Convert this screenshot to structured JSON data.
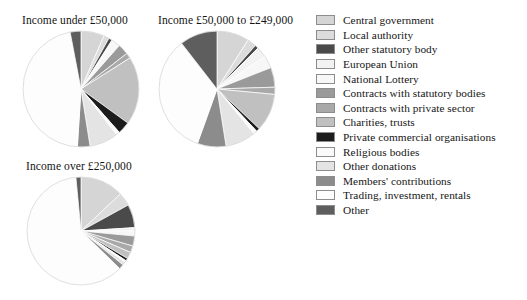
{
  "chart_data": {
    "type": "pie",
    "title": "",
    "legend_position": "right",
    "categories": [
      "Central government",
      "Local authority",
      "Other statutory body",
      "European Union",
      "National Lottery",
      "Contracts with statutory bodies",
      "Contracts with private sector",
      "Charities, trusts",
      "Private commercial organisations",
      "Religious bodies",
      "Other donations",
      "Members' contributions",
      "Trading, investment, rentals",
      "Other"
    ],
    "colors": [
      "#d5d5d5",
      "#dcdcdc",
      "#4a4a4a",
      "#f2f2f2",
      "#f7f7f7",
      "#9a9a9a",
      "#a9a9a9",
      "#c0c0c0",
      "#1c1c1c",
      "#fafafa",
      "#e4e4e4",
      "#8c8c8c",
      "#fdfdfd",
      "#5e5e5e"
    ],
    "charts": [
      {
        "title": "Income under £50,000",
        "values": [
          6.5,
          1.5,
          1.0,
          0.5,
          2.0,
          3.0,
          1.5,
          19.0,
          3.5,
          1.0,
          8.0,
          3.5,
          46.0,
          3.0
        ]
      },
      {
        "title": "Income £50,000 to £249,000",
        "values": [
          9.0,
          2.5,
          1.0,
          3.0,
          3.5,
          5.5,
          2.0,
          10.5,
          1.0,
          1.0,
          8.5,
          8.0,
          34.0,
          10.5
        ]
      },
      {
        "title": "Income over £250,000",
        "values": [
          13.0,
          4.0,
          7.0,
          1.0,
          1.5,
          3.0,
          2.0,
          2.0,
          0.8,
          0.5,
          1.0,
          1.5,
          61.2,
          1.5
        ]
      }
    ]
  },
  "legend": {
    "items": [
      {
        "label": "Central government",
        "color": "#d5d5d5",
        "icon": "legend-swatch-icon"
      },
      {
        "label": "Local authority",
        "color": "#dcdcdc",
        "icon": "legend-swatch-icon"
      },
      {
        "label": "Other statutory body",
        "color": "#4a4a4a",
        "icon": "legend-swatch-icon"
      },
      {
        "label": "European Union",
        "color": "#f2f2f2",
        "icon": "legend-swatch-icon"
      },
      {
        "label": "National Lottery",
        "color": "#f7f7f7",
        "icon": "legend-swatch-icon"
      },
      {
        "label": "Contracts with statutory bodies",
        "color": "#9a9a9a",
        "icon": "legend-swatch-icon"
      },
      {
        "label": "Contracts with private sector",
        "color": "#a9a9a9",
        "icon": "legend-swatch-icon"
      },
      {
        "label": "Charities, trusts",
        "color": "#c0c0c0",
        "icon": "legend-swatch-icon"
      },
      {
        "label": "Private commercial organisations",
        "color": "#1c1c1c",
        "icon": "legend-swatch-icon"
      },
      {
        "label": "Religious bodies",
        "color": "#fafafa",
        "icon": "legend-swatch-icon"
      },
      {
        "label": "Other donations",
        "color": "#e4e4e4",
        "icon": "legend-swatch-icon"
      },
      {
        "label": "Members' contributions",
        "color": "#8c8c8c",
        "icon": "legend-swatch-icon"
      },
      {
        "label": "Trading, investment, rentals",
        "color": "#fdfdfd",
        "icon": "legend-swatch-icon"
      },
      {
        "label": "Other",
        "color": "#5e5e5e",
        "icon": "legend-swatch-icon"
      }
    ]
  },
  "panels": [
    {
      "title": "Income under £50,000",
      "left": 22,
      "top": 14,
      "radius": 57,
      "cx": 72,
      "cy": 93
    },
    {
      "title": "Income £50,000 to £249,000",
      "left": 158,
      "top": 14,
      "radius": 57,
      "cx": 213,
      "cy": 93
    },
    {
      "title": "Income over £250,000",
      "left": 26,
      "top": 160,
      "radius": 53,
      "cx": 90,
      "cy": 232
    }
  ]
}
